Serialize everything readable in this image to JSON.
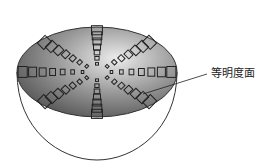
{
  "diagram": {
    "label": "等明度面",
    "shape": "hemisphere",
    "plane": {
      "cx": 97,
      "cy": 72,
      "rx": 80,
      "ry": 45
    },
    "colors": {
      "dark": "#5a5a5a",
      "light": "#e6e6e6",
      "outline": "#333333"
    },
    "spokes": 8
  }
}
